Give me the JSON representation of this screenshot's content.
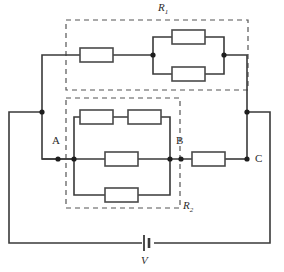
{
  "diagram": {
    "title_symbols": {
      "r1_label": "R",
      "r1_sub": "1",
      "r2_label": "R",
      "r2_sub": "2",
      "battery_label": "V"
    },
    "node_labels": {
      "a": "A",
      "b": "B",
      "c": "C"
    },
    "colors": {
      "wire": "#3a3a3a",
      "resistor_stroke": "#4a4a4a",
      "resistor_fill": "#ffffff",
      "dashed_box": "#555555",
      "node_dot": "#1e1e1e",
      "background": "#ffffff",
      "text": "#2b2b2b"
    },
    "groups": [
      {
        "name": "R1",
        "label": "R1",
        "box": {
          "x": 66,
          "y": 20,
          "w": 182,
          "h": 70
        },
        "description": "Dashed enclosure containing one series resistor followed by two resistors in parallel",
        "resistors": [
          {
            "name": "r1-series-resistor",
            "x": 80,
            "y": 48,
            "w": 33,
            "h": 14
          },
          {
            "name": "r1-parallel-top-resistor",
            "x": 172,
            "y": 30,
            "w": 33,
            "h": 14
          },
          {
            "name": "r1-parallel-bottom-resistor",
            "x": 172,
            "y": 67,
            "w": 33,
            "h": 14
          }
        ],
        "nodes": [
          {
            "name": "r1-parallel-left-node",
            "x": 153,
            "y": 55
          },
          {
            "name": "r1-parallel-right-node",
            "x": 224,
            "y": 55
          }
        ]
      },
      {
        "name": "R2",
        "label": "R2",
        "box": {
          "x": 66,
          "y": 98,
          "w": 114,
          "h": 110
        },
        "description": "Dashed enclosure containing three parallel branches: top branch of two series resistors, middle single resistor, bottom single resistor",
        "resistors": [
          {
            "name": "r2-top-left-resistor",
            "x": 80,
            "y": 110,
            "w": 33,
            "h": 14
          },
          {
            "name": "r2-top-right-resistor",
            "x": 128,
            "y": 110,
            "w": 33,
            "h": 14
          },
          {
            "name": "r2-middle-resistor",
            "x": 105,
            "y": 152,
            "w": 33,
            "h": 14
          },
          {
            "name": "r2-bottom-resistor",
            "x": 105,
            "y": 188,
            "w": 33,
            "h": 14
          }
        ],
        "nodes": [
          {
            "name": "r2-left-node",
            "x": 74,
            "y": 159
          },
          {
            "name": "r2-right-node",
            "x": 170,
            "y": 159
          }
        ]
      }
    ],
    "standalone_resistors": [
      {
        "name": "bc-resistor",
        "x": 192,
        "y": 152,
        "w": 33,
        "h": 14
      }
    ],
    "battery": {
      "name": "battery-v",
      "x": 146,
      "y": 243,
      "long_plate_h": 16,
      "short_plate_h": 10,
      "gap": 4
    },
    "junction_dots": [
      {
        "name": "node-a-dot",
        "x": 58,
        "y": 159
      },
      {
        "name": "node-b-dot",
        "x": 181,
        "y": 159
      },
      {
        "name": "node-c-dot",
        "x": 247,
        "y": 159
      },
      {
        "name": "node-left-top-dot",
        "x": 42,
        "y": 112
      },
      {
        "name": "node-right-top-dot",
        "x": 247,
        "y": 112
      },
      {
        "name": "r2-left-rail-dot",
        "x": 74,
        "y": 159
      },
      {
        "name": "r2-right-rail-dot",
        "x": 170,
        "y": 159
      }
    ],
    "label_positions": {
      "r1": {
        "x": 158,
        "y": 3
      },
      "r2": {
        "x": 183,
        "y": 200
      },
      "a": {
        "x": 52,
        "y": 135
      },
      "b": {
        "x": 176,
        "y": 135
      },
      "c": {
        "x": 255,
        "y": 152
      },
      "v": {
        "x": 141,
        "y": 256
      }
    }
  }
}
